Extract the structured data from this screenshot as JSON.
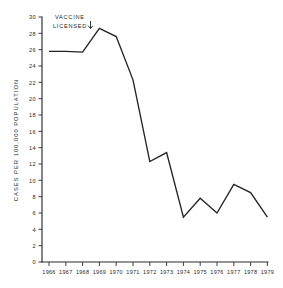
{
  "chart_data": {
    "type": "line",
    "title": "",
    "subtitle": "",
    "xlabel": "",
    "ylabel": "CASES PER 100,000 POPULATION",
    "categories": [
      "1966",
      "1967",
      "1968",
      "1969",
      "1970",
      "1971",
      "1972",
      "1973",
      "1974",
      "1975",
      "1976",
      "1977",
      "1978",
      "1979"
    ],
    "x": [
      1966,
      1967,
      1968,
      1969,
      1970,
      1971,
      1972,
      1973,
      1974,
      1975,
      1976,
      1977,
      1978,
      1979
    ],
    "values": [
      25.8,
      25.8,
      25.7,
      28.6,
      27.6,
      22.3,
      12.3,
      13.4,
      5.5,
      7.8,
      6.0,
      9.5,
      8.5,
      5.5
    ],
    "series": [
      {
        "name": "Cases per 100,000 population",
        "values": [
          25.8,
          25.8,
          25.7,
          28.6,
          27.6,
          22.3,
          12.3,
          13.4,
          5.5,
          7.8,
          6.0,
          9.5,
          8.5,
          5.5
        ]
      }
    ],
    "ylim": [
      0,
      30
    ],
    "yticks": [
      0,
      2,
      4,
      6,
      8,
      10,
      12,
      14,
      16,
      18,
      20,
      22,
      24,
      26,
      28,
      30
    ],
    "ytick_labels": [
      "0",
      "2",
      "4",
      "6",
      "8",
      "10",
      "12",
      "14",
      "16",
      "18",
      "20",
      "22",
      "24",
      "26",
      "28",
      "30"
    ],
    "xlim": [
      1966,
      1979
    ],
    "grid": false,
    "legend": false,
    "legend_position": "none",
    "annotations": [
      {
        "text_line_1": "VACCINE",
        "text_line_2": "LICENSED",
        "marker": "down-arrow",
        "points_to_year": 1969
      }
    ],
    "line_color": "#232323",
    "background_color": "#ffffff",
    "axis_color": "#2a2a2a"
  }
}
